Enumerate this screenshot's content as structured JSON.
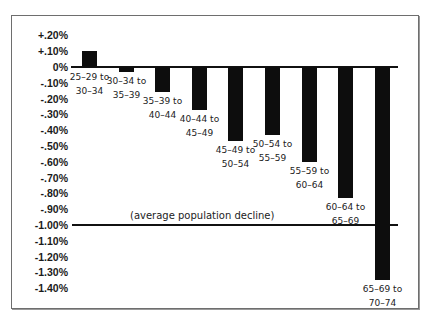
{
  "chart_data": {
    "type": "bar",
    "title": "",
    "xlabel": "",
    "ylabel": "",
    "categories": [
      [
        "25–29 to",
        "30–34"
      ],
      [
        "30–34 to",
        "35–39"
      ],
      [
        "35–39 to",
        "40–44"
      ],
      [
        "40–44 to",
        "45–49"
      ],
      [
        "45–49 to",
        "50–54"
      ],
      [
        "50–54 to",
        "55–59"
      ],
      [
        "55–59 to",
        "60–64"
      ],
      [
        "60–64 to",
        "65–69"
      ],
      [
        "65–69 to",
        "70–74"
      ]
    ],
    "values": [
      0.1,
      -0.03,
      -0.16,
      -0.27,
      -0.47,
      -0.43,
      -0.6,
      -0.83,
      -1.35
    ],
    "unit": "%",
    "ylim": [
      -1.5,
      0.25
    ],
    "yticks": [
      "+.20%",
      "+.10%",
      "0%",
      "-.10%",
      "-.20%",
      "-.30%",
      "-.40%",
      "-.50%",
      "-.60%",
      "-.70%",
      "-.80%",
      "-.90%",
      "-1.00%",
      "-1.10%",
      "-1.20%",
      "-1.30%",
      "-1.40%"
    ],
    "ytick_values": [
      0.2,
      0.1,
      0.0,
      -0.1,
      -0.2,
      -0.3,
      -0.4,
      -0.5,
      -0.6,
      -0.7,
      -0.8,
      -0.9,
      -1.0,
      -1.1,
      -1.2,
      -1.3,
      -1.4
    ],
    "reference_line": {
      "value": -1.0,
      "label": "(average population decline)"
    },
    "grid": false,
    "legend": null,
    "colors": {
      "bar": "#0d0d0d",
      "axis": "#111111",
      "frame": "#6e6e6e"
    }
  }
}
